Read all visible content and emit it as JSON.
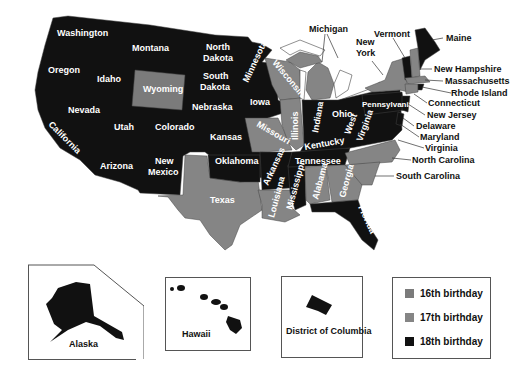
{
  "colors": {
    "16th": "#7b7b7b",
    "17th": "#858585",
    "18th": "#111111",
    "lake": "#ffffff"
  },
  "legend": {
    "items": [
      {
        "label": "16th birthday",
        "color": "#7b7b7b"
      },
      {
        "label": "17th birthday",
        "color": "#858585"
      },
      {
        "label": "18th birthday",
        "color": "#111111"
      }
    ]
  },
  "insets": {
    "alaska": "Alaska",
    "hawaii": "Hawaii",
    "dc": "District of Columbia"
  },
  "states": {
    "washington": "Washington",
    "oregon": "Oregon",
    "california": "California",
    "idaho": "Idaho",
    "nevada": "Nevada",
    "montana": "Montana",
    "wyoming": "Wyoming",
    "utah": "Utah",
    "arizona": "Arizona",
    "colorado": "Colorado",
    "new_mexico_1": "New",
    "new_mexico_2": "Mexico",
    "north_dakota_1": "North",
    "north_dakota_2": "Dakota",
    "south_dakota_1": "South",
    "south_dakota_2": "Dakota",
    "nebraska": "Nebraska",
    "kansas": "Kansas",
    "oklahoma": "Oklahoma",
    "texas": "Texas",
    "minnesota": "Minnesota",
    "iowa": "Iowa",
    "missouri": "Missouri",
    "arkansas": "Arkansas",
    "louisiana": "Louisiana",
    "wisconsin": "Wisconsin",
    "illinois": "Illinois",
    "michigan": "Michigan",
    "indiana": "Indiana",
    "ohio": "Ohio",
    "kentucky": "Kentucky",
    "tennessee": "Tennessee",
    "mississippi": "Mississippi",
    "alabama": "Alabama",
    "georgia": "Georgia",
    "florida": "Florida",
    "south_carolina": "South Carolina",
    "north_carolina": "North Carolina",
    "virginia": "Virginia",
    "west_virginia_1": "West",
    "west_virginia_2": "Virginia",
    "maryland": "Maryland",
    "delaware": "Delaware",
    "new_jersey": "New Jersey",
    "pennsylvania": "Pennsylvania",
    "new_york_1": "New",
    "new_york_2": "York",
    "connecticut": "Connecticut",
    "rhode_island": "Rhode Island",
    "massachusetts": "Massachusetts",
    "vermont": "Vermont",
    "new_hampshire": "New Hampshire",
    "maine": "Maine"
  },
  "state_categories": {
    "16th birthday": [
      "Wyoming"
    ],
    "17th birthday": [
      "Texas",
      "Missouri",
      "Illinois",
      "Wisconsin",
      "Michigan",
      "Louisiana",
      "Alabama",
      "Georgia",
      "South Carolina",
      "North Carolina",
      "New York",
      "New Hampshire",
      "Massachusetts",
      "Connecticut"
    ],
    "18th birthday": [
      "Washington",
      "Oregon",
      "California",
      "Idaho",
      "Nevada",
      "Montana",
      "Utah",
      "Arizona",
      "Colorado",
      "New Mexico",
      "North Dakota",
      "South Dakota",
      "Nebraska",
      "Kansas",
      "Oklahoma",
      "Minnesota",
      "Iowa",
      "Arkansas",
      "Mississippi",
      "Indiana",
      "Ohio",
      "Kentucky",
      "Tennessee",
      "Florida",
      "Virginia",
      "West Virginia",
      "Maryland",
      "Delaware",
      "New Jersey",
      "Pennsylvania",
      "Rhode Island",
      "Vermont",
      "Maine",
      "Alaska",
      "Hawaii",
      "District of Columbia"
    ]
  }
}
